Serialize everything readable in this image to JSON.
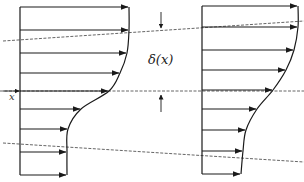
{
  "diagram": {
    "labels": {
      "thickness": "δ(x)",
      "axis": "x"
    },
    "colors": {
      "line": "#1a1a1a",
      "dashed": "#555555",
      "background": "#ffffff"
    },
    "left_profile": {
      "axis_x": 20,
      "arrows": [
        {
          "y": 7,
          "tip": 128
        },
        {
          "y": 30,
          "tip": 128
        },
        {
          "y": 53,
          "tip": 126
        },
        {
          "y": 73,
          "tip": 119
        },
        {
          "y": 91,
          "tip": 108
        },
        {
          "y": 109,
          "tip": 80
        },
        {
          "y": 129,
          "tip": 67
        },
        {
          "y": 152,
          "tip": 66
        },
        {
          "y": 175,
          "tip": 66
        }
      ]
    },
    "right_profile": {
      "axis_x": 202,
      "arrows": [
        {
          "y": 6,
          "tip": 297
        },
        {
          "y": 27,
          "tip": 297
        },
        {
          "y": 50,
          "tip": 293
        },
        {
          "y": 70,
          "tip": 285
        },
        {
          "y": 90,
          "tip": 272
        },
        {
          "y": 109,
          "tip": 256
        },
        {
          "y": 130,
          "tip": 245
        },
        {
          "y": 151,
          "tip": 242
        },
        {
          "y": 174,
          "tip": 240
        }
      ]
    },
    "dashed_lines": [
      {
        "x1": 3,
        "y1": 41,
        "x2": 304,
        "y2": 21
      },
      {
        "x1": 0,
        "y1": 91,
        "x2": 304,
        "y2": 91
      },
      {
        "x1": 3,
        "y1": 143,
        "x2": 304,
        "y2": 162
      }
    ]
  }
}
